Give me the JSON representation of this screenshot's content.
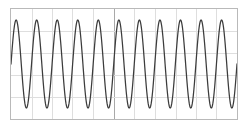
{
  "figure": {
    "background_color": "#ffffff",
    "frame_color": "#b9b9b9",
    "grid_color": "#dedede",
    "center_line_color": "#a8a8a8",
    "trace_color": "#3c3c3c"
  },
  "chart_data": {
    "type": "line",
    "title": "",
    "subtitle": "",
    "xlabel": "",
    "ylabel": "",
    "xlim": [
      0,
      11
    ],
    "ylim": [
      -1.25,
      1.25
    ],
    "grid": true,
    "legend": null,
    "legend_position": "none",
    "xticks": [
      0,
      1,
      2,
      3,
      4,
      5,
      6,
      7,
      8,
      9,
      10,
      11
    ],
    "xticklabels": [],
    "yticks": [
      -1,
      -0.5,
      0,
      0.5,
      1
    ],
    "yticklabels": [],
    "annotations": [],
    "waveform": {
      "shape": "sine",
      "cycles": 11,
      "amplitude": 1.0,
      "offset": 0.0,
      "phase_deg": 0,
      "samples_per_cycle": 72,
      "clipped": false
    },
    "series": [
      {
        "name": "trace",
        "color": "#3c3c3c",
        "style": "solid",
        "width": 1.25
      }
    ]
  },
  "grid_layout": {
    "vertical_divisions": 11,
    "horizontal_divisions": 5,
    "center_vertical_index": 5,
    "frame": {
      "x": 10,
      "y": 8,
      "width": 228,
      "height": 112
    }
  }
}
